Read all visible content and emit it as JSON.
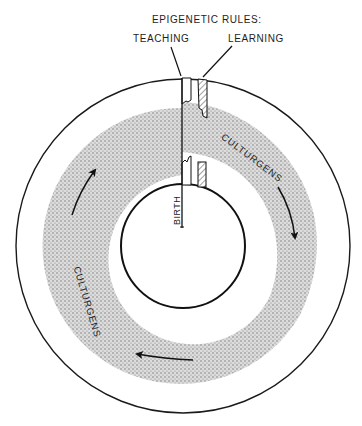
{
  "diagram": {
    "title": "EPIGENETIC RULES:",
    "channels": {
      "left_label": "TEACHING",
      "right_label": "LEARNING"
    },
    "band_labels": {
      "right": "CULTURGENS",
      "left": "CULTURGENS"
    },
    "inner_label": "BIRTH",
    "arrows": [
      "clockwise-right",
      "clockwise-bottom",
      "clockwise-left"
    ],
    "colors": {
      "ink": "#1a1a1a",
      "stipple": "#9a9a9a",
      "background": "#ffffff"
    }
  }
}
